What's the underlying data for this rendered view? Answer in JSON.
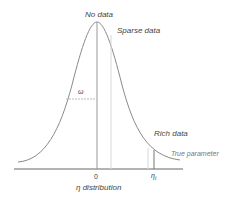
{
  "diagram": {
    "labels": {
      "peak": "No data",
      "sparse": "Sparse data",
      "rich": "Rich data",
      "true_param": "True parameter",
      "width": "ω",
      "zero": "0",
      "eta_t": "η",
      "eta_sub": "t",
      "xlabel": "η distribution"
    },
    "colors": {
      "curve": "#8a8a8a",
      "axis": "#666666",
      "guide": "#d0d0d0",
      "text": "#444444"
    }
  }
}
